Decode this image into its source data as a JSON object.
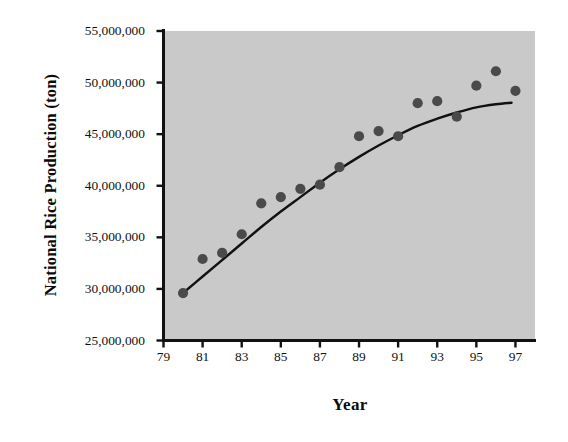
{
  "chart_data": {
    "type": "scatter",
    "title": "",
    "xlabel": "Year",
    "ylabel": "National Rice Production (ton)",
    "xlim": [
      79,
      98
    ],
    "ylim": [
      25000000,
      55000000
    ],
    "grid": false,
    "legend": "none",
    "x_tick_labels": [
      "79",
      "81",
      "83",
      "85",
      "87",
      "89",
      "91",
      "93",
      "95",
      "97"
    ],
    "x_tick_values": [
      79,
      81,
      83,
      85,
      87,
      89,
      91,
      93,
      95,
      97
    ],
    "y_tick_labels": [
      "25,000,000",
      "30,000,000",
      "35,000,000",
      "40,000,000",
      "45,000,000",
      "50,000,000",
      "55,000,000"
    ],
    "y_tick_values": [
      25000000,
      30000000,
      35000000,
      40000000,
      45000000,
      50000000,
      55000000
    ],
    "x": [
      80,
      81,
      82,
      83,
      84,
      85,
      86,
      87,
      88,
      89,
      90,
      91,
      92,
      93,
      94,
      95,
      96,
      97
    ],
    "values": [
      29600000,
      32900000,
      33500000,
      35300000,
      38300000,
      38900000,
      39700000,
      40100000,
      41800000,
      44800000,
      45300000,
      44800000,
      48000000,
      48200000,
      46700000,
      49700000,
      51100000,
      49200000
    ],
    "series": [
      {
        "name": "National Rice Production",
        "marker": "circle",
        "marker_color": "#4a4a4a",
        "values": [
          29600000,
          32900000,
          33500000,
          35300000,
          38300000,
          38900000,
          39700000,
          40100000,
          41800000,
          44800000,
          45300000,
          44800000,
          48000000,
          48200000,
          46700000,
          49700000,
          51100000,
          49200000
        ]
      }
    ],
    "trend_line": {
      "name": "fitted trend curve",
      "color": "#111111",
      "x": [
        80,
        81,
        82,
        83,
        84,
        85,
        86,
        87,
        88,
        89,
        90,
        91,
        92,
        93,
        94,
        95,
        96,
        96.8
      ],
      "values": [
        29600000,
        31200000,
        32800000,
        34400000,
        36000000,
        37500000,
        38900000,
        40300000,
        41600000,
        42800000,
        43900000,
        44900000,
        45800000,
        46500000,
        47100000,
        47600000,
        47900000,
        48050000
      ]
    },
    "plot_background_color": "#c9c9c9",
    "axis_color": "#111111",
    "figure_background_color": "#ffffff"
  }
}
